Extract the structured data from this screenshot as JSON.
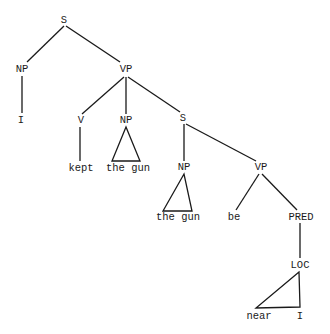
{
  "diagram": {
    "type": "syntax-tree",
    "colors": {
      "ink": "#1a1a1a",
      "background": "#ffffff"
    },
    "nodes": [
      {
        "id": "s1",
        "label": "S",
        "x": 64,
        "y": 20
      },
      {
        "id": "np1",
        "label": "NP",
        "x": 22,
        "y": 69
      },
      {
        "id": "vp1",
        "label": "VP",
        "x": 126,
        "y": 69
      },
      {
        "id": "i1",
        "label": "I",
        "x": 21,
        "y": 120
      },
      {
        "id": "v1",
        "label": "V",
        "x": 81,
        "y": 120
      },
      {
        "id": "np2",
        "label": "NP",
        "x": 126,
        "y": 120
      },
      {
        "id": "s2",
        "label": "S",
        "x": 183,
        "y": 118
      },
      {
        "id": "kept",
        "label": "kept",
        "x": 81,
        "y": 168
      },
      {
        "id": "gun1",
        "label": "the gun",
        "x": 128,
        "y": 168
      },
      {
        "id": "np3",
        "label": "NP",
        "x": 184,
        "y": 167
      },
      {
        "id": "vp2",
        "label": "VP",
        "x": 261,
        "y": 167
      },
      {
        "id": "gun2",
        "label": "the gun",
        "x": 178,
        "y": 217
      },
      {
        "id": "be",
        "label": "be",
        "x": 234,
        "y": 217
      },
      {
        "id": "pred",
        "label": "PRED",
        "x": 301,
        "y": 217
      },
      {
        "id": "loc",
        "label": "LOC",
        "x": 300,
        "y": 265
      },
      {
        "id": "near",
        "label": "near",
        "x": 259,
        "y": 316
      },
      {
        "id": "i2",
        "label": "I",
        "x": 300,
        "y": 316
      }
    ],
    "edges": [
      {
        "x1": 64,
        "y1": 26,
        "x2": 27,
        "y2": 62
      },
      {
        "x1": 66,
        "y1": 26,
        "x2": 120,
        "y2": 62
      },
      {
        "x1": 22,
        "y1": 76,
        "x2": 22,
        "y2": 113
      },
      {
        "x1": 124,
        "y1": 77,
        "x2": 82,
        "y2": 114
      },
      {
        "x1": 126,
        "y1": 77,
        "x2": 126,
        "y2": 114
      },
      {
        "x1": 128,
        "y1": 77,
        "x2": 180,
        "y2": 112
      },
      {
        "x1": 80,
        "y1": 127,
        "x2": 80,
        "y2": 161
      },
      {
        "x1": 184,
        "y1": 124,
        "x2": 184,
        "y2": 161
      },
      {
        "x1": 186,
        "y1": 124,
        "x2": 256,
        "y2": 161
      },
      {
        "x1": 259,
        "y1": 174,
        "x2": 236,
        "y2": 210
      },
      {
        "x1": 262,
        "y1": 174,
        "x2": 297,
        "y2": 210
      },
      {
        "x1": 300,
        "y1": 223,
        "x2": 300,
        "y2": 258
      }
    ],
    "triangles": [
      {
        "points": "126,127 112,161 140,161"
      },
      {
        "points": "184,174 163,211 192,211"
      },
      {
        "points": "299,272 256,308 300,307"
      }
    ]
  }
}
